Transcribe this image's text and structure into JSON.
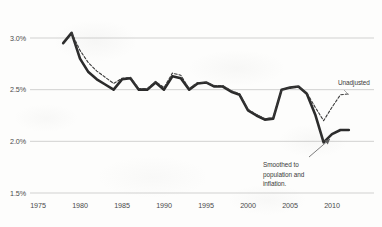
{
  "chart_data": {
    "type": "line",
    "title": "",
    "subtitle": "",
    "xlabel": "",
    "ylabel": "",
    "xlim": [
      1973,
      2013
    ],
    "ylim": [
      0.015,
      0.03
    ],
    "grid": true,
    "grid_axis": "y",
    "legend_position": "inline-annotation",
    "y_tick_labels": [
      "3.0%",
      "2.5%",
      "2.0%",
      "1.5%"
    ],
    "y_tick_values": [
      0.03,
      0.025,
      0.02,
      0.015
    ],
    "x_tick_labels": [
      "1975",
      "1980",
      "1985",
      "1990",
      "1995",
      "2000",
      "2005",
      "2010"
    ],
    "x_tick_values": [
      1975,
      1980,
      1985,
      1990,
      1995,
      2000,
      2005,
      2010
    ],
    "annotations": [
      {
        "name": "smoothed-series-annotation",
        "lines": [
          "Smoothed to",
          "population and",
          "inflation."
        ],
        "text": "Smoothed to population and inflation.",
        "points_to_series": "Smoothed to population and inflation."
      },
      {
        "name": "unadjusted-series-label",
        "text": "Unadjusted",
        "points_to_series": "Unadjusted"
      }
    ],
    "series": [
      {
        "name": "Smoothed to population and inflation.",
        "style": "solid",
        "color": "#2b2b2b",
        "linewidth": 2.6,
        "x": [
          1978,
          1979,
          1980,
          1981,
          1982,
          1983,
          1984,
          1985,
          1986,
          1987,
          1988,
          1989,
          1990,
          1991,
          1992,
          1993,
          1994,
          1995,
          1996,
          1997,
          1998,
          1999,
          2000,
          2001,
          2002,
          2003,
          2004,
          2005,
          2006,
          2007,
          2008,
          2009,
          2010,
          2011,
          2012
        ],
        "values": [
          2.95,
          3.05,
          2.8,
          2.67,
          2.6,
          2.55,
          2.5,
          2.6,
          2.61,
          2.5,
          2.5,
          2.57,
          2.5,
          2.63,
          2.61,
          2.5,
          2.56,
          2.57,
          2.53,
          2.53,
          2.48,
          2.45,
          2.3,
          2.25,
          2.21,
          2.22,
          2.5,
          2.52,
          2.53,
          2.46,
          2.26,
          1.99,
          2.07,
          2.11,
          2.11
        ]
      },
      {
        "name": "Unadjusted",
        "style": "dashed",
        "color": "#3a3a3a",
        "linewidth": 1.1,
        "x": [
          1979,
          1980,
          1981,
          1982,
          1983,
          1984,
          1985,
          1986,
          1987,
          1988,
          1989,
          1990,
          1991,
          1992,
          1993,
          1994,
          1995,
          1996,
          1997,
          1998,
          1999,
          2000,
          2001,
          2002,
          2003,
          2004,
          2005,
          2006,
          2007,
          2008,
          2009,
          2010,
          2011,
          2012
        ],
        "values": [
          3.05,
          2.88,
          2.76,
          2.68,
          2.62,
          2.56,
          2.61,
          2.62,
          2.51,
          2.51,
          2.58,
          2.52,
          2.66,
          2.64,
          2.51,
          2.57,
          2.57,
          2.54,
          2.54,
          2.49,
          2.46,
          2.31,
          2.26,
          2.22,
          2.23,
          2.5,
          2.52,
          2.53,
          2.47,
          2.33,
          2.2,
          2.33,
          2.45,
          2.46
        ]
      }
    ]
  },
  "colors": {
    "background": "#fdfdfc",
    "gridline": "#c9c9c9",
    "axis_text": "#4a4a4a",
    "annotation_text": "#3a3a3a",
    "smoothed_line": "#2b2b2b",
    "unadjusted_line": "#3a3a3a"
  }
}
